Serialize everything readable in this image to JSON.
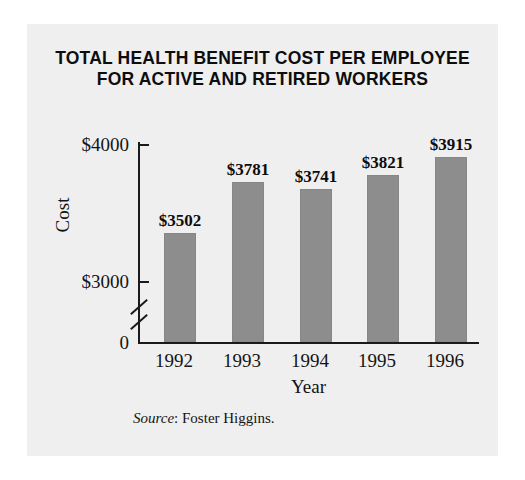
{
  "chart_data": {
    "type": "bar",
    "title": "TOTAL HEALTH BENEFIT COST PER EMPLOYEE FOR ACTIVE AND RETIRED WORKERS",
    "title_line1": "TOTAL HEALTH BENEFIT COST PER EMPLOYEE",
    "title_line2": "FOR ACTIVE AND RETIRED WORKERS",
    "categories": [
      "1992",
      "1993",
      "1994",
      "1995",
      "1996"
    ],
    "values": [
      3502,
      3781,
      3741,
      3821,
      3915
    ],
    "value_labels": [
      "$3502",
      "$3781",
      "$3741",
      "$3821",
      "$3915"
    ],
    "xlabel": "Year",
    "ylabel": "Cost",
    "ylim": [
      3000,
      4000
    ],
    "y_tick_labels": [
      "$4000",
      "$3000",
      "0"
    ],
    "y_axis_break": true,
    "grid": false,
    "legend": null,
    "bar_color": "#8d8d8d",
    "background_color": "#efefef",
    "axis_color": "#1a1a1a",
    "source": {
      "label": "Source",
      "separator": ": ",
      "text": "Foster Higgins."
    }
  }
}
